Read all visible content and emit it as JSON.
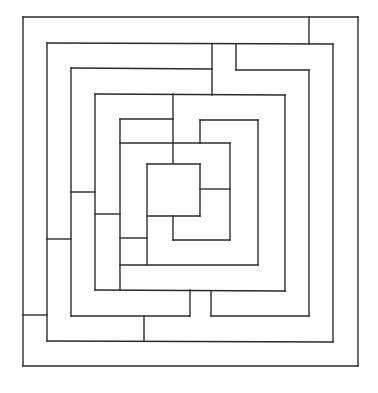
{
  "diagram": {
    "type": "maze",
    "shape": "square-concentric",
    "width": 378,
    "height": 393,
    "background_color": "#ffffff",
    "wall_color": "#2b2b2b",
    "walls": [
      [
        23,
        17,
        358,
        17
      ],
      [
        23,
        17,
        23,
        366
      ],
      [
        23,
        366,
        358,
        366
      ],
      [
        358,
        17,
        358,
        366
      ],
      [
        309,
        17,
        309,
        44
      ],
      [
        47,
        43,
        333,
        44
      ],
      [
        47,
        43,
        47,
        341
      ],
      [
        47,
        341,
        333,
        342
      ],
      [
        333,
        44,
        333,
        342
      ],
      [
        71,
        68,
        212,
        69
      ],
      [
        71,
        68,
        71,
        316
      ],
      [
        236,
        44,
        236,
        70
      ],
      [
        236,
        70,
        309,
        70
      ],
      [
        309,
        70,
        309,
        316
      ],
      [
        212,
        44,
        212,
        95
      ],
      [
        95,
        94,
        285,
        95
      ],
      [
        95,
        94,
        95,
        290
      ],
      [
        285,
        95,
        285,
        291
      ],
      [
        173,
        94,
        173,
        163
      ],
      [
        120,
        119,
        173,
        119
      ],
      [
        120,
        119,
        120,
        290
      ],
      [
        120,
        143,
        230,
        143
      ],
      [
        200,
        120,
        258,
        120
      ],
      [
        200,
        120,
        200,
        143
      ],
      [
        258,
        120,
        258,
        265
      ],
      [
        147,
        164,
        200,
        164
      ],
      [
        147,
        164,
        147,
        265
      ],
      [
        200,
        164,
        200,
        216
      ],
      [
        147,
        216,
        200,
        216
      ],
      [
        200,
        189,
        230,
        189
      ],
      [
        230,
        143,
        230,
        240
      ],
      [
        173,
        216,
        173,
        240
      ],
      [
        173,
        240,
        230,
        240
      ],
      [
        120,
        265,
        258,
        265
      ],
      [
        120,
        238,
        147,
        238
      ],
      [
        71,
        192,
        95,
        192
      ],
      [
        95,
        214,
        120,
        214
      ],
      [
        47,
        239,
        71,
        239
      ],
      [
        95,
        290,
        285,
        291
      ],
      [
        190,
        290,
        190,
        316
      ],
      [
        211,
        291,
        211,
        316
      ],
      [
        211,
        316,
        309,
        316
      ],
      [
        71,
        316,
        190,
        316
      ],
      [
        144,
        316,
        144,
        341
      ],
      [
        23,
        315,
        47,
        315
      ]
    ]
  }
}
